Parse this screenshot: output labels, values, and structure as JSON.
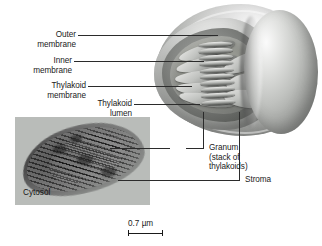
{
  "figure": {
    "background_color": "#ffffff",
    "leader_line_color": "#2b2b2b"
  },
  "labels": {
    "outer_membrane": "Outer\nmembrane",
    "inner_membrane": "Inner\nmembrane",
    "thylakoid_membrane": "Thylakoid\nmembrane",
    "thylakoid_lumen": "Thylakoid\nlumen",
    "granum": "Granum\n(stack of\nthylakoids)",
    "stroma": "Stroma",
    "cytosol": "Cytosol"
  },
  "scale_bar": {
    "value": "0.7",
    "unit": "µm",
    "text": "0.7 µm",
    "length_px": 35
  },
  "micrograph": {
    "kind": "transmission-electron-micrograph",
    "background_color": "#b9bcb9",
    "caption": "Cytosol"
  },
  "illustration": {
    "kind": "cut-away-chloroplast-3d",
    "granum_disc_count": 10
  }
}
